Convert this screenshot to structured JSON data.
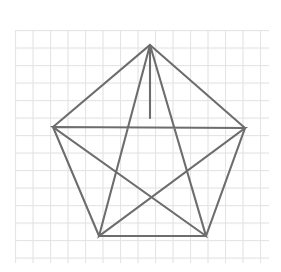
{
  "canvas": {
    "width": 281,
    "height": 272,
    "background_color": "#ffffff",
    "title": "Pentagon with inscribed pentagram on graph paper"
  },
  "grid": {
    "name": "graph-paper-grid",
    "visible": true,
    "origin_x": 15,
    "origin_y": 30,
    "end_x": 269,
    "end_y": 263,
    "cell_size": 17.5,
    "columns": 15,
    "rows": 14,
    "line_color": "#dedede",
    "line_width": 1,
    "minor_line_color": "#ededed"
  },
  "figure": {
    "name": "pentagon-pentagram",
    "stroke_color": "#6d6d6d",
    "stroke_width": 2.1,
    "fill": "none",
    "line_join": "miter",
    "pentagon": {
      "label": "outer-pentagon",
      "sides": 5,
      "vertex_labels": [
        "top",
        "right",
        "bottom-right",
        "bottom-left",
        "left"
      ],
      "vertices": [
        {
          "label": "top",
          "x": 150,
          "y": 45
        },
        {
          "label": "right",
          "x": 245,
          "y": 128
        },
        {
          "label": "bottom-right",
          "x": 206,
          "y": 236
        },
        {
          "label": "bottom-left",
          "x": 99,
          "y": 236
        },
        {
          "label": "left",
          "x": 53,
          "y": 127
        }
      ],
      "points_attr": "150,45 245,128 206,236 99,236 53,127"
    },
    "pentagram": {
      "label": "inscribed-pentagram",
      "description": "Five-pointed star formed by connecting each pentagon vertex to the two non-adjacent vertices",
      "points_attr": "150,45 206,236 53,127 245,128 99,236 150,45",
      "chords": [
        {
          "label": "top-to-bottom-right",
          "x1": 150,
          "y1": 45,
          "x2": 206,
          "y2": 236
        },
        {
          "label": "bottom-right-to-left",
          "x1": 206,
          "y1": 236,
          "x2": 53,
          "y2": 127
        },
        {
          "label": "left-to-right",
          "x1": 53,
          "y1": 127,
          "x2": 245,
          "y2": 128
        },
        {
          "label": "right-to-bottom-left",
          "x1": 245,
          "y1": 128,
          "x2": 99,
          "y2": 236
        },
        {
          "label": "bottom-left-to-top",
          "x1": 99,
          "y1": 236,
          "x2": 150,
          "y2": 45
        }
      ]
    },
    "apex_segment": {
      "label": "vertical-apex-line",
      "description": "Vertical line from pentagon top vertex down to the inner star apex",
      "x1": 150,
      "y1": 45,
      "x2": 150,
      "y2": 118
    },
    "inner_pentagon": {
      "label": "star-inner-pentagon",
      "description": "Central pentagon region formed where the five chords intersect",
      "vertices": [
        {
          "label": "inner-top",
          "x": 150,
          "y": 118
        },
        {
          "label": "inner-right",
          "x": 186,
          "y": 146
        },
        {
          "label": "inner-bottom-right",
          "x": 172,
          "y": 188
        },
        {
          "label": "inner-bottom-left",
          "x": 128,
          "y": 188
        },
        {
          "label": "inner-left",
          "x": 114,
          "y": 146
        }
      ]
    }
  }
}
